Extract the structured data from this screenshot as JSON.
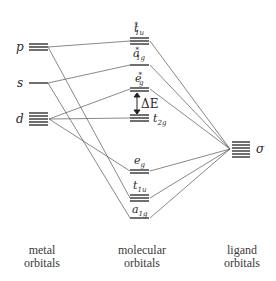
{
  "diagram": {
    "type": "molecular orbital energy-level diagram",
    "metal_orbitals": {
      "p": {
        "label": "p",
        "degeneracy": 3,
        "y": 47
      },
      "s": {
        "label": "s",
        "degeneracy": 1,
        "y": 83
      },
      "d": {
        "label": "d",
        "degeneracy": 5,
        "y": 119
      }
    },
    "molecular_orbitals": {
      "t1u_star": {
        "base": "t",
        "sub": "1u",
        "sup": "*",
        "degeneracy": 3,
        "y": 41
      },
      "a1g_star": {
        "base": "a",
        "sub": "1g",
        "sup": "*",
        "degeneracy": 1,
        "y": 65
      },
      "eg_star": {
        "base": "e",
        "sub": "g",
        "sup": "*",
        "degeneracy": 2,
        "y": 89
      },
      "t2g": {
        "base": "t",
        "sub": "2g",
        "sup": "",
        "degeneracy": 3,
        "y": 118
      },
      "eg": {
        "base": "e",
        "sub": "g",
        "sup": "",
        "degeneracy": 2,
        "y": 171
      },
      "t1u": {
        "base": "t",
        "sub": "1u",
        "sup": "",
        "degeneracy": 3,
        "y": 198
      },
      "a1g": {
        "base": "a",
        "sub": "1g",
        "sup": "",
        "degeneracy": 1,
        "y": 218
      }
    },
    "ligand_orbitals": {
      "sigma": {
        "label": "σ",
        "degeneracy": 6,
        "y": 149
      }
    },
    "gap_label": "ΔE",
    "captions": {
      "metal": [
        "metal",
        "orbitals"
      ],
      "molecular": [
        "molecular",
        "orbitals"
      ],
      "ligand": [
        "ligand",
        "orbitals"
      ]
    }
  }
}
